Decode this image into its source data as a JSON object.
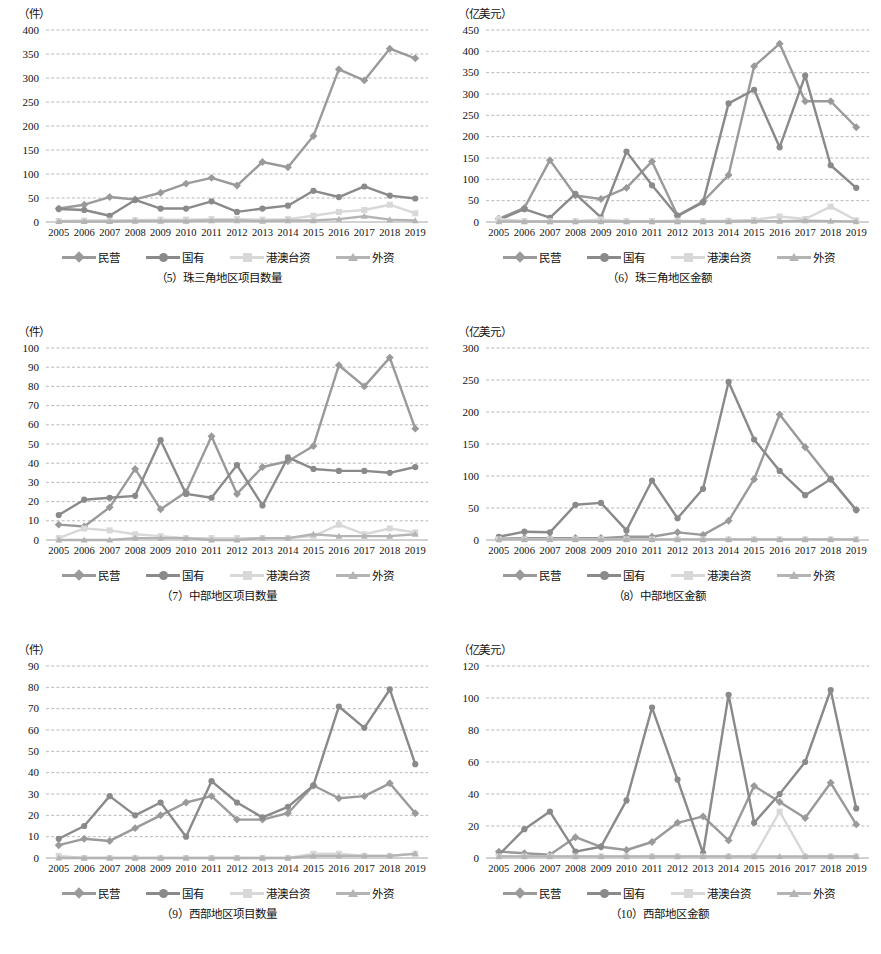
{
  "figure": {
    "series_names": [
      "民营",
      "国有",
      "港澳台资",
      "外资"
    ],
    "series_colors": [
      "#9a9a9a",
      "#8a8a8a",
      "#d8d8d8",
      "#b4b4b4"
    ],
    "markers": [
      "diamond",
      "circle",
      "square",
      "triangle"
    ],
    "years": [
      "2005",
      "2006",
      "2007",
      "2008",
      "2009",
      "2010",
      "2011",
      "2012",
      "2013",
      "2014",
      "2015",
      "2016",
      "2017",
      "2018",
      "2019"
    ]
  },
  "charts": [
    {
      "id": "chart-5",
      "caption": "（5）珠三角地区项目数量",
      "yunit": "（件）",
      "chart_data": {
        "type": "line",
        "title": "（5）珠三角地区项目数量",
        "xlabel": "",
        "ylabel": "件",
        "ylim": [
          0,
          400
        ],
        "ytick_step": 50,
        "yticks": [
          0,
          50,
          100,
          150,
          200,
          250,
          300,
          350,
          400
        ],
        "grid": true,
        "legend_position": "bottom",
        "x": [
          "2005",
          "2006",
          "2007",
          "2008",
          "2009",
          "2010",
          "2011",
          "2012",
          "2013",
          "2014",
          "2015",
          "2016",
          "2017",
          "2018",
          "2019"
        ],
        "series": [
          {
            "name": "民营",
            "values": [
              28,
              36,
              52,
              47,
              61,
              80,
              92,
              76,
              125,
              114,
              179,
              318,
              295,
              361,
              341
            ]
          },
          {
            "name": "国有",
            "values": [
              27,
              25,
              13,
              46,
              28,
              28,
              43,
              21,
              28,
              34,
              65,
              52,
              74,
              55,
              49
            ]
          },
          {
            "name": "港澳台资",
            "values": [
              2,
              3,
              3,
              4,
              5,
              5,
              6,
              6,
              5,
              6,
              13,
              21,
              25,
              36,
              18
            ]
          },
          {
            "name": "外资",
            "values": [
              1,
              1,
              1,
              2,
              2,
              2,
              3,
              3,
              2,
              3,
              3,
              6,
              12,
              5,
              3
            ]
          }
        ]
      }
    },
    {
      "id": "chart-6",
      "caption": "（6）珠三角地区金额",
      "yunit": "（亿美元）",
      "chart_data": {
        "type": "line",
        "title": "（6）珠三角地区金额",
        "xlabel": "",
        "ylabel": "亿美元",
        "ylim": [
          0,
          450
        ],
        "ytick_step": 50,
        "yticks": [
          0,
          50,
          100,
          150,
          200,
          250,
          300,
          350,
          400,
          450
        ],
        "grid": true,
        "legend_position": "bottom",
        "x": [
          "2005",
          "2006",
          "2007",
          "2008",
          "2009",
          "2010",
          "2011",
          "2012",
          "2013",
          "2014",
          "2015",
          "2016",
          "2017",
          "2018",
          "2019"
        ],
        "series": [
          {
            "name": "民营",
            "values": [
              8,
              33,
              145,
              62,
              54,
              80,
              142,
              15,
              48,
              110,
              365,
              418,
              283,
              283,
              222
            ]
          },
          {
            "name": "国有",
            "values": [
              5,
              30,
              10,
              66,
              11,
              165,
              86,
              14,
              46,
              278,
              310,
              175,
              343,
              133,
              80
            ]
          },
          {
            "name": "港澳台资",
            "values": [
              7,
              2,
              2,
              2,
              6,
              2,
              2,
              3,
              2,
              3,
              5,
              13,
              7,
              36,
              4
            ]
          },
          {
            "name": "外资",
            "values": [
              1,
              1,
              1,
              1,
              1,
              1,
              1,
              1,
              1,
              1,
              2,
              2,
              3,
              2,
              1
            ]
          }
        ]
      }
    },
    {
      "id": "chart-7",
      "caption": "（7）中部地区项目数量",
      "yunit": "（件）",
      "chart_data": {
        "type": "line",
        "title": "（7）中部地区项目数量",
        "xlabel": "",
        "ylabel": "件",
        "ylim": [
          0,
          100
        ],
        "ytick_step": 10,
        "yticks": [
          0,
          10,
          20,
          30,
          40,
          50,
          60,
          70,
          80,
          90,
          100
        ],
        "grid": true,
        "legend_position": "bottom",
        "x": [
          "2005",
          "2006",
          "2007",
          "2008",
          "2009",
          "2010",
          "2011",
          "2012",
          "2013",
          "2014",
          "2015",
          "2016",
          "2017",
          "2018",
          "2019"
        ],
        "series": [
          {
            "name": "民营",
            "values": [
              8,
              7,
              17,
              37,
              16,
              25,
              54,
              24,
              38,
              41,
              49,
              91,
              80,
              95,
              58
            ]
          },
          {
            "name": "国有",
            "values": [
              13,
              21,
              22,
              23,
              52,
              24,
              22,
              39,
              18,
              43,
              37,
              36,
              36,
              35,
              38
            ]
          },
          {
            "name": "港澳台资",
            "values": [
              1,
              6,
              5,
              3,
              2,
              1,
              1,
              1,
              1,
              1,
              2,
              8,
              3,
              6,
              4
            ]
          },
          {
            "name": "外资",
            "values": [
              0,
              0,
              0,
              1,
              1,
              1,
              0,
              0,
              1,
              1,
              3,
              2,
              2,
              2,
              3
            ]
          }
        ]
      }
    },
    {
      "id": "chart-8",
      "caption": "（8）中部地区金额",
      "yunit": "（亿美元）",
      "chart_data": {
        "type": "line",
        "title": "（8）中部地区金额",
        "xlabel": "",
        "ylabel": "亿美元",
        "ylim": [
          0,
          300
        ],
        "ytick_step": 50,
        "yticks": [
          0,
          50,
          100,
          150,
          200,
          250,
          300
        ],
        "grid": true,
        "legend_position": "bottom",
        "x": [
          "2005",
          "2006",
          "2007",
          "2008",
          "2009",
          "2010",
          "2011",
          "2012",
          "2013",
          "2014",
          "2015",
          "2016",
          "2017",
          "2018",
          "2019"
        ],
        "series": [
          {
            "name": "民营",
            "values": [
              2,
              3,
              3,
              3,
              3,
              5,
              5,
              12,
              8,
              30,
              95,
              196,
              145,
              95,
              47
            ]
          },
          {
            "name": "国有",
            "values": [
              5,
              13,
              12,
              55,
              58,
              15,
              93,
              34,
              80,
              247,
              157,
              108,
              70,
              95,
              47
            ]
          },
          {
            "name": "港澳台资",
            "values": [
              1,
              1,
              1,
              1,
              1,
              1,
              1,
              1,
              1,
              1,
              1,
              1,
              1,
              1,
              1
            ]
          },
          {
            "name": "外资",
            "values": [
              1,
              1,
              1,
              1,
              1,
              1,
              1,
              1,
              1,
              1,
              1,
              1,
              1,
              1,
              1
            ]
          }
        ]
      }
    },
    {
      "id": "chart-9",
      "caption": "（9）西部地区项目数量",
      "yunit": "（件）",
      "chart_data": {
        "type": "line",
        "title": "（9）西部地区项目数量",
        "xlabel": "",
        "ylabel": "件",
        "ylim": [
          0,
          90
        ],
        "ytick_step": 10,
        "yticks": [
          0,
          10,
          20,
          30,
          40,
          50,
          60,
          70,
          80,
          90
        ],
        "grid": true,
        "legend_position": "bottom",
        "x": [
          "2005",
          "2006",
          "2007",
          "2008",
          "2009",
          "2010",
          "2011",
          "2012",
          "2013",
          "2014",
          "2015",
          "2016",
          "2017",
          "2018",
          "2019"
        ],
        "series": [
          {
            "name": "民营",
            "values": [
              6,
              9,
              8,
              14,
              20,
              26,
              29,
              18,
              18,
              21,
              34,
              28,
              29,
              35,
              21
            ]
          },
          {
            "name": "国有",
            "values": [
              9,
              15,
              29,
              20,
              26,
              10,
              36,
              26,
              19,
              24,
              34,
              71,
              61,
              79,
              44
            ]
          },
          {
            "name": "港澳台资",
            "values": [
              1,
              0,
              0,
              0,
              0,
              0,
              0,
              0,
              0,
              0,
              2,
              2,
              1,
              1,
              2
            ]
          },
          {
            "name": "外资",
            "values": [
              0,
              0,
              0,
              0,
              0,
              0,
              0,
              0,
              0,
              0,
              1,
              1,
              1,
              1,
              2
            ]
          }
        ]
      }
    },
    {
      "id": "chart-10",
      "caption": "（10）西部地区金额",
      "yunit": "（亿美元）",
      "chart_data": {
        "type": "line",
        "title": "（10）西部地区金额",
        "xlabel": "",
        "ylabel": "亿美元",
        "ylim": [
          0,
          120
        ],
        "ytick_step": 20,
        "yticks": [
          0,
          20,
          40,
          60,
          80,
          100,
          120
        ],
        "grid": true,
        "legend_position": "bottom",
        "x": [
          "2005",
          "2006",
          "2007",
          "2008",
          "2009",
          "2010",
          "2011",
          "2012",
          "2013",
          "2014",
          "2015",
          "2016",
          "2017",
          "2018",
          "2019"
        ],
        "series": [
          {
            "name": "民营",
            "values": [
              4,
              3,
              2,
              13,
              7,
              5,
              10,
              22,
              26,
              11,
              45,
              35,
              25,
              47,
              21
            ]
          },
          {
            "name": "国有",
            "values": [
              2,
              18,
              29,
              4,
              7,
              36,
              94,
              49,
              3,
              102,
              22,
              40,
              60,
              105,
              31
            ]
          },
          {
            "name": "港澳台资",
            "values": [
              1,
              1,
              1,
              1,
              1,
              1,
              1,
              1,
              1,
              1,
              1,
              29,
              1,
              1,
              1
            ]
          },
          {
            "name": "外资",
            "values": [
              1,
              1,
              1,
              1,
              1,
              1,
              1,
              1,
              1,
              1,
              1,
              1,
              1,
              1,
              1
            ]
          }
        ]
      }
    }
  ]
}
